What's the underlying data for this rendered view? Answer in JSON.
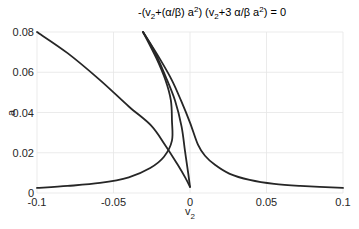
{
  "chart_data": {
    "type": "line",
    "title_parts": [
      "-(v",
      "2",
      "+(α/β) a",
      "2",
      ") (v",
      "2",
      "+3 α/β a",
      "2",
      ") = 0"
    ],
    "title": "-(v2+(α/β) a2) (v2+3 α/β a2) = 0",
    "xlabel_main": "v",
    "xlabel_sub": "2",
    "ylabel": "a",
    "xlim": [
      -0.1,
      0.1
    ],
    "ylim": [
      0,
      0.08
    ],
    "xticks": [
      -0.1,
      -0.05,
      0,
      0.05,
      0.1
    ],
    "xtick_labels": [
      "-0.1",
      "-0.05",
      "0",
      "0.05",
      "0.1"
    ],
    "yticks": [
      0,
      0.02,
      0.04,
      0.06,
      0.08
    ],
    "ytick_labels": [
      "0",
      "0.02",
      "0.04",
      "0.06",
      "0.08"
    ],
    "grid": true,
    "line_color": "#262626",
    "series": [
      {
        "name": "curve-left-descending",
        "x": [
          -0.1,
          -0.08,
          -0.0588,
          -0.04,
          -0.0255,
          -0.0163,
          -0.008,
          -0.003,
          0.0
        ],
        "y": [
          0.08,
          0.0695,
          0.0561,
          0.043,
          0.0336,
          0.0239,
          0.014,
          0.0075,
          0.003
        ]
      },
      {
        "name": "curve-left-hyperbola",
        "x": [
          -0.1,
          -0.08,
          -0.0588,
          -0.04,
          -0.026,
          -0.017,
          -0.0118,
          -0.0118,
          -0.0125,
          -0.016,
          -0.022,
          -0.0307
        ],
        "y": [
          0.0025,
          0.0035,
          0.005,
          0.0078,
          0.0124,
          0.018,
          0.026,
          0.036,
          0.046,
          0.056,
          0.067,
          0.08
        ]
      },
      {
        "name": "curve-middle",
        "x": [
          -0.0307,
          -0.023,
          -0.016,
          -0.0098,
          -0.0055,
          -0.0033,
          -0.0012,
          0.0
        ],
        "y": [
          0.08,
          0.07,
          0.058,
          0.046,
          0.033,
          0.021,
          0.01,
          0.003
        ]
      },
      {
        "name": "curve-right",
        "x": [
          -0.0307,
          -0.02,
          -0.0118,
          -0.0059,
          0.0,
          0.0052,
          0.0098,
          0.0163,
          0.026,
          0.039,
          0.055,
          0.072,
          0.1
        ],
        "y": [
          0.08,
          0.067,
          0.056,
          0.046,
          0.035,
          0.024,
          0.0185,
          0.014,
          0.0095,
          0.0065,
          0.0045,
          0.0035,
          0.0025
        ]
      }
    ]
  }
}
